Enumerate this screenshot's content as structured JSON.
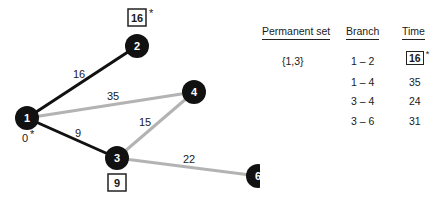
{
  "graph": {
    "nodes": [
      {
        "id": "1",
        "label": "1",
        "x": 27,
        "y": 118
      },
      {
        "id": "2",
        "label": "2",
        "x": 137,
        "y": 46
      },
      {
        "id": "3",
        "label": "3",
        "x": 117,
        "y": 158
      },
      {
        "id": "4",
        "label": "4",
        "x": 194,
        "y": 92
      },
      {
        "id": "6",
        "label": "6",
        "x": 258,
        "y": 176
      }
    ],
    "edges": [
      {
        "from": "1",
        "to": "2",
        "weight": "16",
        "style": "permanent"
      },
      {
        "from": "1",
        "to": "4",
        "weight": "35",
        "style": "tentative"
      },
      {
        "from": "1",
        "to": "3",
        "weight": "9",
        "style": "permanent"
      },
      {
        "from": "3",
        "to": "4",
        "weight": "15",
        "style": "tentative"
      },
      {
        "from": "3",
        "to": "6",
        "weight": "22",
        "style": "tentative"
      }
    ],
    "node1_time": "0",
    "node1_star": "*",
    "node2_time": "16",
    "node2_star": "*",
    "node3_time": "9",
    "colors": {
      "node": "#111111",
      "permanent_edge": "#111111",
      "tentative_edge": "#b3b3b3"
    }
  },
  "table": {
    "headers": {
      "permanent_set": "Permanent set",
      "branch": "Branch",
      "time": "Time"
    },
    "permanent_set": "{1,3}",
    "rows": [
      {
        "branch": "1 – 2",
        "time": "16",
        "boxed": true,
        "star": "*"
      },
      {
        "branch": "1 – 4",
        "time": "35"
      },
      {
        "branch": "3 – 4",
        "time": "24"
      },
      {
        "branch": "3 – 6",
        "time": "31"
      }
    ]
  }
}
